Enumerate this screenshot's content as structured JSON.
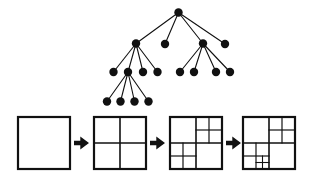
{
  "figure": {
    "background_color": "#ffffff",
    "ink_color": "#111111",
    "node_color": "#111111",
    "edge_color": "#111111"
  },
  "tree": {
    "name": "quadtree-node-tree",
    "node_radius": 4.2,
    "levels": [
      {
        "level": 0,
        "label": "root",
        "nodes": [
          {
            "id": "r",
            "x": 178.5,
            "y": 12.5
          }
        ]
      },
      {
        "level": 1,
        "label": "quadrants",
        "nodes": [
          {
            "id": "a",
            "x": 136.0,
            "y": 43.5
          },
          {
            "id": "b",
            "x": 165.0,
            "y": 44.0
          },
          {
            "id": "c",
            "x": 203.0,
            "y": 43.5
          },
          {
            "id": "d",
            "x": 225.0,
            "y": 44.0
          }
        ]
      },
      {
        "level": 2,
        "label": "sub-quadrants",
        "nodes": [
          {
            "id": "a1",
            "x": 113.5,
            "y": 72.0
          },
          {
            "id": "a2",
            "x": 128.0,
            "y": 72.0
          },
          {
            "id": "a3",
            "x": 143.0,
            "y": 72.0
          },
          {
            "id": "a4",
            "x": 157.5,
            "y": 72.0
          },
          {
            "id": "c1",
            "x": 180.0,
            "y": 72.0
          },
          {
            "id": "c2",
            "x": 194.0,
            "y": 72.0
          },
          {
            "id": "c3",
            "x": 216.0,
            "y": 72.0
          },
          {
            "id": "c4",
            "x": 230.0,
            "y": 72.0
          }
        ]
      },
      {
        "level": 3,
        "label": "leaf-quadrants",
        "nodes": [
          {
            "id": "b1",
            "x": 107.0,
            "y": 101.5
          },
          {
            "id": "b2",
            "x": 120.5,
            "y": 101.5
          },
          {
            "id": "b3",
            "x": 134.5,
            "y": 101.5
          },
          {
            "id": "b4",
            "x": 148.5,
            "y": 101.5
          }
        ]
      }
    ],
    "edges": [
      {
        "from": "r",
        "to": "a"
      },
      {
        "from": "r",
        "to": "b"
      },
      {
        "from": "r",
        "to": "c"
      },
      {
        "from": "r",
        "to": "d"
      },
      {
        "from": "a",
        "to": "a1"
      },
      {
        "from": "a",
        "to": "a2"
      },
      {
        "from": "a",
        "to": "a3"
      },
      {
        "from": "a",
        "to": "a4"
      },
      {
        "from": "c",
        "to": "c1"
      },
      {
        "from": "c",
        "to": "c2"
      },
      {
        "from": "c",
        "to": "c3"
      },
      {
        "from": "c",
        "to": "c4"
      },
      {
        "from": "a2",
        "to": "b1"
      },
      {
        "from": "a2",
        "to": "b2"
      },
      {
        "from": "a2",
        "to": "b3"
      },
      {
        "from": "a2",
        "to": "b4"
      }
    ]
  },
  "decomposition": {
    "name": "quadtree-subdivision-sequence",
    "square_size": 52,
    "top": 117,
    "stroke_outer": 2.2,
    "stroke_inner": 1.6,
    "stroke_deep": 1.2,
    "steps": [
      {
        "index": 0,
        "label": "step-1-undivided",
        "x": 18,
        "splits": []
      },
      {
        "index": 1,
        "label": "step-2-quad-split",
        "x": 94,
        "splits": [
          {
            "path": "",
            "depth": 1
          }
        ]
      },
      {
        "index": 2,
        "label": "step-3-two-quadrants-split",
        "x": 170,
        "splits": [
          {
            "path": "",
            "depth": 1
          },
          {
            "path": "NE",
            "depth": 2
          },
          {
            "path": "SW",
            "depth": 2
          }
        ]
      },
      {
        "index": 3,
        "label": "step-4-deep-split",
        "x": 243,
        "splits": [
          {
            "path": "",
            "depth": 1
          },
          {
            "path": "NE",
            "depth": 2
          },
          {
            "path": "SW",
            "depth": 2
          },
          {
            "path": "SW.SE",
            "depth": 3
          }
        ]
      }
    ],
    "arrows": [
      {
        "label": "arrow-1",
        "x": 74,
        "y": 143
      },
      {
        "label": "arrow-2",
        "x": 150,
        "y": 143
      },
      {
        "label": "arrow-3",
        "x": 226,
        "y": 143
      }
    ],
    "arrow_width": 15,
    "arrow_height": 13
  }
}
